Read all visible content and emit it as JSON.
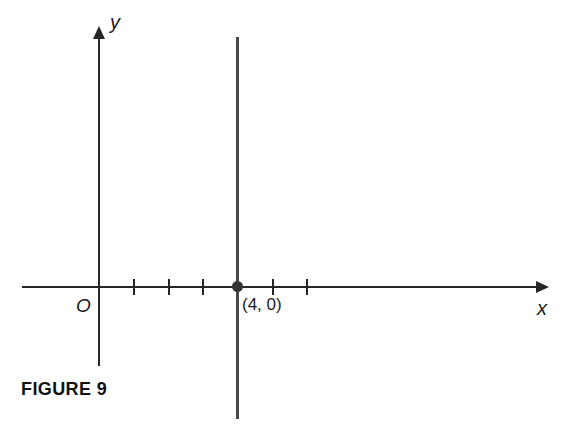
{
  "figure": {
    "caption": "FIGURE 9",
    "equation_of_line": "x = 4",
    "axes": {
      "x_label": "x",
      "y_label": "y",
      "origin_label": "O"
    },
    "point": {
      "label": "(4, 0)",
      "x": 4,
      "y": 0
    },
    "x_ticks": [
      1,
      2,
      3,
      4,
      5,
      6
    ],
    "layout_scale": {
      "origin_px_x": 99.5,
      "unit_px": 34.6
    },
    "colors": {
      "axis": "#262626",
      "graph_line": "#484848",
      "point": "#333333",
      "text": "#1c1c1c",
      "background": "#ffffff"
    }
  }
}
